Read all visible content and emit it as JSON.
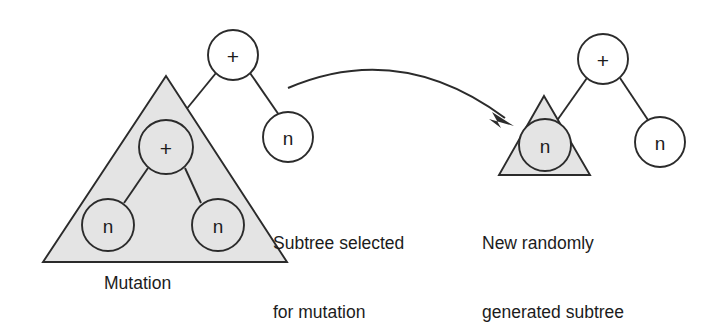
{
  "diagram": {
    "title": "Mutation",
    "captions": {
      "mutation": "Mutation",
      "subtree_selected_line1": "Subtree selected",
      "subtree_selected_line2": "for mutation",
      "new_subtree_line1": "New randomly",
      "new_subtree_line2": "generated subtree"
    },
    "colors": {
      "stroke": "#2b2b2b",
      "shaded_fill": "#e4e4e4",
      "node_fill": "#ffffff",
      "background": "#ffffff",
      "text": "#1c1c1c"
    },
    "left_tree": {
      "name": "parent-tree-with-selected-subtree",
      "root": {
        "label": "+",
        "kind": "operator",
        "cx": 233,
        "cy": 55,
        "r": 25
      },
      "right_child": {
        "label": "n",
        "kind": "terminal",
        "cx": 288,
        "cy": 137,
        "r": 25
      },
      "selected_subtree": {
        "triangle": {
          "apex_x": 166,
          "apex_y": 76,
          "base_left_x": 43,
          "base_right_x": 287,
          "base_y": 262
        },
        "root": {
          "label": "+",
          "kind": "operator",
          "cx": 166,
          "cy": 147,
          "r": 27
        },
        "children": [
          {
            "label": "n",
            "kind": "terminal",
            "cx": 108,
            "cy": 225,
            "r": 26
          },
          {
            "label": "n",
            "kind": "terminal",
            "cx": 218,
            "cy": 225,
            "r": 26
          }
        ]
      }
    },
    "right_tree": {
      "name": "offspring-tree-with-new-subtree",
      "root": {
        "label": "+",
        "kind": "operator",
        "cx": 603,
        "cy": 59,
        "r": 25
      },
      "right_child": {
        "label": "n",
        "kind": "terminal",
        "cx": 660,
        "cy": 142,
        "r": 25
      },
      "new_subtree": {
        "triangle": {
          "apex_x": 544,
          "apex_y": 96,
          "base_left_x": 499,
          "base_right_x": 590,
          "base_y": 175
        },
        "root": {
          "label": "n",
          "kind": "terminal",
          "cx": 545,
          "cy": 145,
          "r": 26
        }
      }
    },
    "arrow": {
      "name": "mutation-replacement-arrow",
      "from_x": 288,
      "from_y": 88,
      "to_x": 514,
      "to_y": 125,
      "control_x": 400,
      "control_y": 58
    }
  }
}
